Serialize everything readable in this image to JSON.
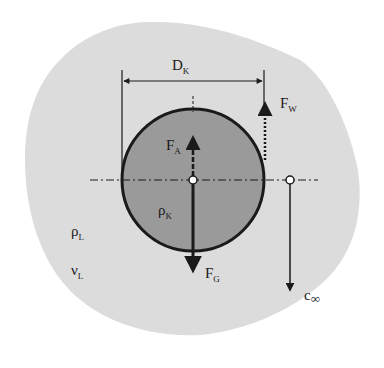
{
  "diagram": {
    "colors": {
      "fluid": "#dcdcdc",
      "sphere": "#9a9a9a",
      "stroke": "#1a1a1a",
      "background": "#ffffff"
    },
    "labels": {
      "diameter": {
        "main": "D",
        "sub": "K"
      },
      "drag_force": {
        "main": "F",
        "sub": "W"
      },
      "buoyancy_force": {
        "main": "F",
        "sub": "A"
      },
      "gravity_force": {
        "main": "F",
        "sub": "G"
      },
      "sphere_density": {
        "main": "ρ",
        "sub": "K"
      },
      "fluid_density": {
        "main": "ρ",
        "sub": "L"
      },
      "fluid_viscosity": {
        "main": "ν",
        "sub": "L"
      },
      "terminal_velocity": {
        "main": "c",
        "sub": "∞"
      }
    }
  }
}
